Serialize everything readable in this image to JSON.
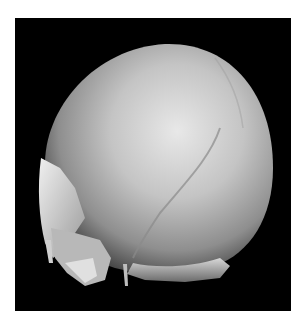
{
  "image": {
    "subject": "3D rendered skull (CT volume rendering), posterolateral view",
    "background_color": "#000000",
    "page_color": "#ffffff"
  }
}
